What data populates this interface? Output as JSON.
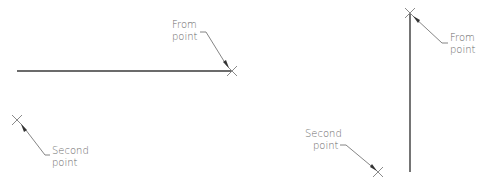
{
  "diagram": {
    "left_figure": {
      "line": {
        "x1": 17,
        "y1": 71,
        "x2": 232,
        "y2": 71,
        "orientation": "horizontal"
      },
      "from_point": {
        "x": 232,
        "y": 71,
        "label_line1": "From",
        "label_line2": "point"
      },
      "second_point": {
        "x": 17,
        "y": 120,
        "label_line1": "Second",
        "label_line2": "point"
      }
    },
    "right_figure": {
      "line": {
        "x1": 410,
        "y1": 13,
        "x2": 410,
        "y2": 172,
        "orientation": "vertical"
      },
      "from_point": {
        "x": 410,
        "y": 13,
        "label_line1": "From",
        "label_line2": "point"
      },
      "second_point": {
        "x": 378,
        "y": 172,
        "label_line1": "Second",
        "label_line2": "point"
      }
    },
    "colors": {
      "line": "#3a3a3a",
      "leader": "#777777",
      "text": "#6a6a6a",
      "background": "#ffffff"
    }
  }
}
